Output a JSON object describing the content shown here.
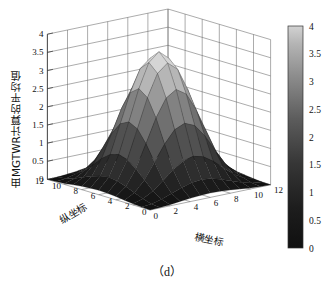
{
  "figure": {
    "caption": "（d）",
    "background": "#ffffff",
    "colormap": "grayscale",
    "line_color": "#555555"
  },
  "axes": {
    "z": {
      "label": "由MGTWR计算的平均值",
      "ticks": [
        "0",
        "0.5",
        "1",
        "1.5",
        "2",
        "2.5",
        "3",
        "3.5",
        "4"
      ],
      "range": [
        0,
        4
      ]
    },
    "y": {
      "label": "纵坐标",
      "ticks": [
        "0",
        "2",
        "4",
        "6",
        "8",
        "10",
        "12"
      ],
      "range": [
        0,
        12
      ]
    },
    "x": {
      "label": "横坐标",
      "ticks": [
        "0",
        "2",
        "4",
        "6",
        "8",
        "10",
        "12"
      ],
      "range": [
        0,
        12
      ]
    }
  },
  "colorbar": {
    "ticks": [
      "0",
      "0.5",
      "1",
      "1.5",
      "2",
      "2.5",
      "3",
      "3.5",
      "4"
    ],
    "min": 0,
    "max": 4,
    "low_color": "#1a1a1a",
    "high_color": "#cfcfcf",
    "position": "right"
  },
  "chart_data": {
    "type": "surface",
    "title": "",
    "xlabel": "横坐标",
    "ylabel": "纵坐标",
    "zlabel": "由MGTWR计算的平均值",
    "xlim": [
      0,
      12
    ],
    "ylim": [
      0,
      12
    ],
    "zlim": [
      0,
      4
    ],
    "grid": true,
    "colorbar_range": [
      0,
      4
    ],
    "x": [
      0,
      1,
      2,
      3,
      4,
      5,
      6,
      7,
      8,
      9,
      10,
      11,
      12
    ],
    "y": [
      0,
      1,
      2,
      3,
      4,
      5,
      6,
      7,
      8,
      9,
      10,
      11,
      12
    ],
    "peak": {
      "x": 6,
      "y": 6,
      "z": 3.0
    },
    "z": [
      [
        0.0,
        0.01,
        0.03,
        0.06,
        0.09,
        0.11,
        0.12,
        0.11,
        0.09,
        0.06,
        0.03,
        0.01,
        0.0
      ],
      [
        0.01,
        0.04,
        0.11,
        0.21,
        0.31,
        0.39,
        0.42,
        0.39,
        0.31,
        0.21,
        0.11,
        0.04,
        0.01
      ],
      [
        0.03,
        0.11,
        0.27,
        0.5,
        0.74,
        0.92,
        0.99,
        0.92,
        0.74,
        0.5,
        0.27,
        0.11,
        0.03
      ],
      [
        0.06,
        0.21,
        0.5,
        0.93,
        1.37,
        1.71,
        1.83,
        1.71,
        1.37,
        0.93,
        0.5,
        0.21,
        0.06
      ],
      [
        0.09,
        0.31,
        0.74,
        1.37,
        2.02,
        2.51,
        2.69,
        2.51,
        2.02,
        1.37,
        0.74,
        0.31,
        0.09
      ],
      [
        0.11,
        0.39,
        0.92,
        1.71,
        2.51,
        3.12,
        3.35,
        3.12,
        2.51,
        1.71,
        0.92,
        0.39,
        0.11
      ],
      [
        0.12,
        0.42,
        0.99,
        1.83,
        2.69,
        3.35,
        3.59,
        3.35,
        2.69,
        1.83,
        0.99,
        0.42,
        0.12
      ],
      [
        0.11,
        0.39,
        0.92,
        1.71,
        2.51,
        3.12,
        3.35,
        3.12,
        2.51,
        1.71,
        0.92,
        0.39,
        0.11
      ],
      [
        0.09,
        0.31,
        0.74,
        1.37,
        2.02,
        2.51,
        2.69,
        2.51,
        2.02,
        1.37,
        0.74,
        0.31,
        0.09
      ],
      [
        0.06,
        0.21,
        0.5,
        0.93,
        1.37,
        1.71,
        1.83,
        1.71,
        1.37,
        0.93,
        0.5,
        0.21,
        0.06
      ],
      [
        0.03,
        0.11,
        0.27,
        0.5,
        0.74,
        0.92,
        0.99,
        0.92,
        0.74,
        0.5,
        0.27,
        0.11,
        0.03
      ],
      [
        0.01,
        0.04,
        0.11,
        0.21,
        0.31,
        0.39,
        0.42,
        0.39,
        0.31,
        0.21,
        0.11,
        0.04,
        0.01
      ],
      [
        0.0,
        0.01,
        0.03,
        0.06,
        0.09,
        0.11,
        0.12,
        0.11,
        0.09,
        0.06,
        0.03,
        0.01,
        0.0
      ]
    ]
  }
}
